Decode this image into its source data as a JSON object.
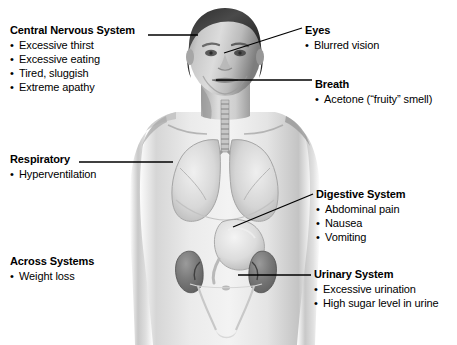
{
  "diagram": {
    "palette": {
      "background": "#ffffff",
      "leader_line": "#000000",
      "text": "#000000",
      "skin_light": "#e9e9e9",
      "skin_mid": "#bdbdbd",
      "skin_shadow": "#8d8d8d",
      "organ_dark": "#6e6e6e",
      "organ_mid": "#9a9a9a",
      "hair_dark": "#3a3a3a"
    }
  },
  "callouts": [
    {
      "id": "central-nervous-system",
      "title": "Central Nervous System",
      "items": [
        "Excessive thirst",
        "Excessive eating",
        "Tired, sluggish",
        "Extreme apathy"
      ]
    },
    {
      "id": "eyes",
      "title": "Eyes",
      "items": [
        "Blurred vision"
      ]
    },
    {
      "id": "breath",
      "title": "Breath",
      "items": [
        "Acetone (“fruity” smell)"
      ]
    },
    {
      "id": "respiratory",
      "title": "Respiratory",
      "items": [
        "Hyperventilation"
      ]
    },
    {
      "id": "digestive-system",
      "title": "Digestive System",
      "items": [
        "Abdominal pain",
        "Nausea",
        "Vomiting"
      ]
    },
    {
      "id": "across-systems",
      "title": "Across Systems",
      "items": [
        "Weight loss"
      ]
    },
    {
      "id": "urinary-system",
      "title": "Urinary System",
      "items": [
        "Excessive urination",
        "High sugar level in urine"
      ]
    }
  ]
}
